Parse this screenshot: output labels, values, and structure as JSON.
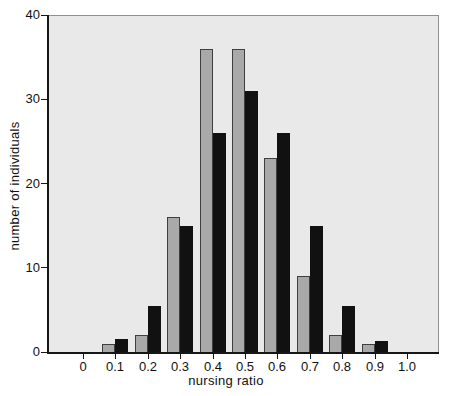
{
  "chart_data": {
    "type": "bar",
    "title": "",
    "xlabel": "nursing ratio",
    "ylabel": "number of individuals",
    "categories": [
      "0",
      "0.1",
      "0.2",
      "0.3",
      "0.4",
      "0.5",
      "0.6",
      "0.7",
      "0.8",
      "0.9",
      "1.0"
    ],
    "series": [
      {
        "name": "gray-bars",
        "color": "#a9a9a9",
        "border_color": "#3f3f3f",
        "values": [
          0,
          1,
          2,
          16,
          36,
          36,
          23,
          9,
          2,
          1,
          0
        ]
      },
      {
        "name": "black-bars",
        "color": "#111111",
        "border_color": "#111111",
        "values": [
          0,
          1.5,
          5.5,
          15,
          26,
          31,
          26,
          15,
          5.5,
          1.3,
          0
        ]
      }
    ],
    "ylim": [
      0,
      40
    ],
    "yticks": [
      0,
      10,
      20,
      30,
      40
    ],
    "xlim": [
      0,
      1.0
    ],
    "grid": false,
    "legend": "none",
    "plot_background": "#e9e9e9",
    "frame_color": "#8f8f8f",
    "axis_color": "#161616",
    "page_background": "#ffffff"
  }
}
